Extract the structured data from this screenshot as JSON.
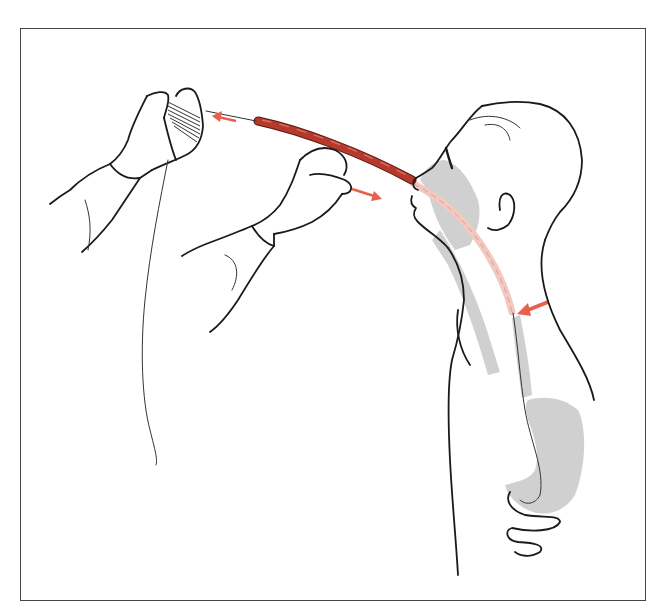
{
  "figure": {
    "elements": {
      "patient": "profile-head-and-torso",
      "hands_left": "hand-holding-coiled-tube",
      "hands_right": "hand-guiding-tube",
      "tube_external": "red-tube",
      "tube_internal": "pink-tube-in-esophagus",
      "esophagus_stomach": "gray-shaded-digestive-tract"
    },
    "arrows": [
      {
        "name": "pull-arrow-left",
        "direction": "left"
      },
      {
        "name": "advance-arrow",
        "direction": "right-down"
      },
      {
        "name": "tube-tip-arrow",
        "direction": "left"
      }
    ],
    "colors": {
      "tube": "#b5392c",
      "tube_highlight": "#d9735f",
      "tube_internal": "#f2c9c0",
      "arrow": "#e8604a",
      "shade": "#c8c8c8",
      "ink": "#1a1a1a",
      "frame": "#444444"
    }
  }
}
